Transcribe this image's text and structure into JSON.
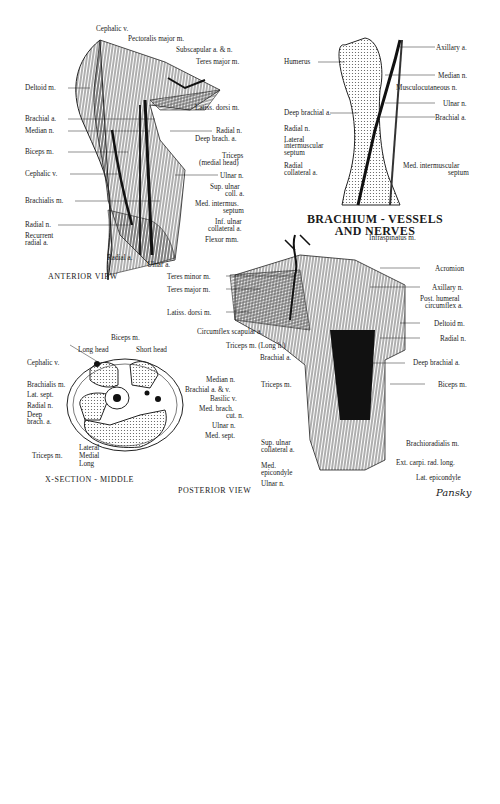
{
  "title": {
    "line1": "BRACHIUM - VESSELS",
    "line2": "AND NERVES"
  },
  "anterior": {
    "caption": "ANTERIOR VIEW",
    "labels": [
      "Cephalic v.",
      "Pectoralis major m.",
      "Subscapular a. & n.",
      "Teres major m.",
      "Deltoid m.",
      "Latiss. dorsi m.",
      "Brachial a.",
      "Median n.",
      "Radial n.",
      "Deep brach. a.",
      "Biceps m.",
      "Triceps",
      "(medial head)",
      "Cephalic v.",
      "Ulnar n.",
      "Sup. ulnar",
      "coll. a.",
      "Brachialis m.",
      "Med. intermus.",
      "septum",
      "Radial n.",
      "Inf. ulnar",
      "collateral a.",
      "Recurrent",
      "radial a.",
      "Flexor mm.",
      "Radial a.",
      "Ulnar a."
    ]
  },
  "humerus": {
    "labels": [
      "Axillary a.",
      "Humerus",
      "Median n.",
      "Musculocutaneous n.",
      "Ulnar n.",
      "Deep brachial a.",
      "Brachial a.",
      "Radial n.",
      "Lateral",
      "intermuscular",
      "septum",
      "Radial",
      "collateral a.",
      "Med. intermuscular",
      "septum"
    ]
  },
  "posterior": {
    "caption": "POSTERIOR VIEW",
    "labels": [
      "Infraspinatus m.",
      "Acromion",
      "Teres minor m.",
      "Axillary n.",
      "Teres major m.",
      "Post. humeral",
      "circumflex a.",
      "Latiss. dorsi m.",
      "Deltoid m.",
      "Circumflex scapular a.",
      "Radial n.",
      "Triceps m. (Long h.)",
      "Brachial a.",
      "Deep brachial a.",
      "Triceps m.",
      "Biceps m.",
      "Sup. ulnar",
      "collateral a.",
      "Brachioradialis m.",
      "Med.",
      "epicondyle",
      "Ext. carpi. rad. long.",
      "Lat. epicondyle",
      "Ulnar n."
    ],
    "signature": "Pansky"
  },
  "xsection": {
    "caption": "X-SECTION - MIDDLE",
    "labels": [
      "Biceps m.",
      "Long head",
      "Short head",
      "Cephalic v.",
      "Median n.",
      "Brachialis m.",
      "Brachial a. & v.",
      "Lat. sept.",
      "Basilic v.",
      "Radial n.",
      "Med. brach.",
      "cut. n.",
      "Deep",
      "brach. a.",
      "Ulnar n.",
      "Med. sept.",
      "Lateral",
      "Triceps m.",
      "Medial",
      "Long"
    ]
  }
}
